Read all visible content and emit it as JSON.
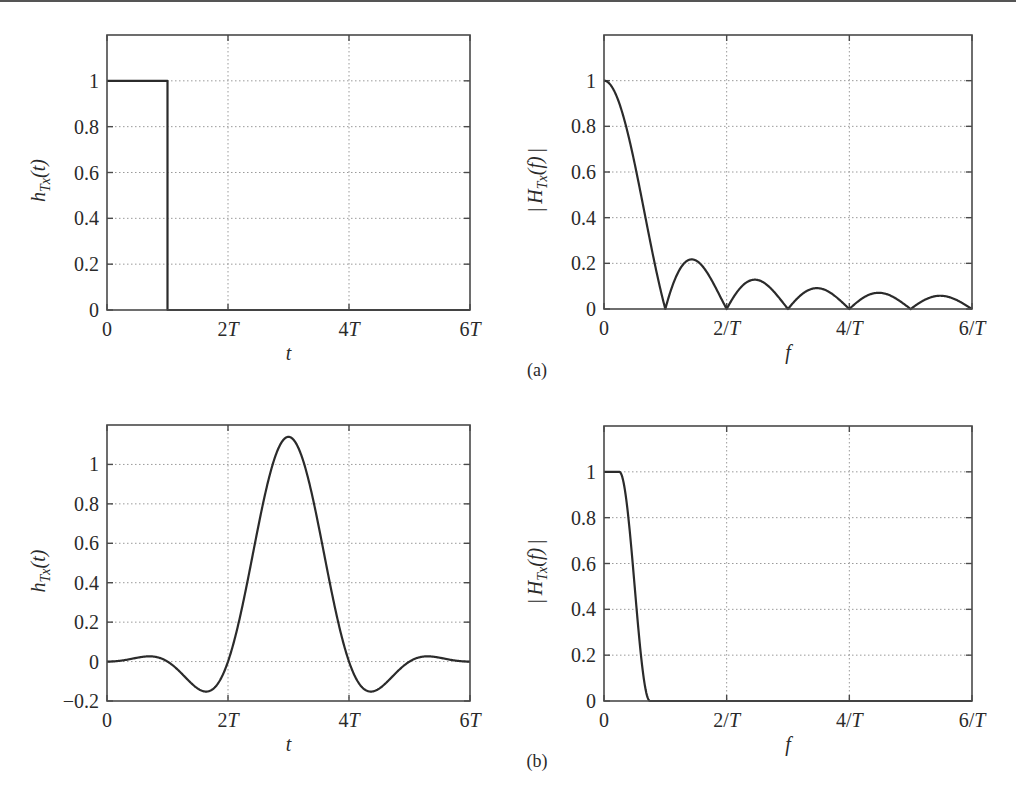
{
  "figure": {
    "panel_labels": [
      "(a)",
      "(b)"
    ]
  },
  "chart_data": [
    {
      "id": "a-time",
      "type": "line",
      "panel": "(a)",
      "title": "",
      "xlabel": "t",
      "ylabel": "h_Tx(t)",
      "ylabel_parts": {
        "base": "h",
        "sub": "Tx",
        "suffix": "(t)"
      },
      "xlim": [
        0,
        6
      ],
      "ylim": [
        0,
        1.2
      ],
      "xticks": [
        0,
        2,
        4,
        6
      ],
      "xtick_labels": [
        "0",
        "2T",
        "4T",
        "6T"
      ],
      "yticks": [
        0,
        0.2,
        0.4,
        0.6,
        0.8,
        1
      ],
      "ytick_labels": [
        "0",
        "0.2",
        "0.4",
        "0.6",
        "0.8",
        "1"
      ],
      "grid": true,
      "description": "Rectangular pulse of height 1 from t=0 to t=T",
      "series": [
        {
          "name": "h_Tx(t)",
          "x": [
            0,
            0,
            1,
            1,
            6
          ],
          "y": [
            1,
            1,
            1,
            0,
            0
          ]
        }
      ],
      "box": {
        "left": 107,
        "top": 35,
        "right": 470,
        "bottom": 310
      }
    },
    {
      "id": "a-freq",
      "type": "line",
      "panel": "(a)",
      "title": "",
      "xlabel": "f",
      "ylabel": "|H_Tx(f)|",
      "ylabel_parts": {
        "base": "H",
        "sub": "Tx",
        "suffix": "(f)"
      },
      "xlim": [
        0,
        6
      ],
      "ylim": [
        0,
        1.2
      ],
      "xticks": [
        0,
        2,
        4,
        6
      ],
      "xtick_labels": [
        "0",
        "2/T",
        "4/T",
        "6/T"
      ],
      "yticks": [
        0,
        0.2,
        0.4,
        0.6,
        0.8,
        1
      ],
      "ytick_labels": [
        "0",
        "0.2",
        "0.4",
        "0.6",
        "0.8",
        "1"
      ],
      "grid": true,
      "description": "|sinc(fT)|, zeros at integer multiples of 1/T",
      "series": [
        {
          "name": "|H_Tx(f)|",
          "x": [
            0,
            0.25,
            0.5,
            0.75,
            1,
            1.25,
            1.5,
            1.75,
            2,
            2.25,
            2.5,
            2.75,
            3,
            3.25,
            3.5,
            3.75,
            4,
            4.25,
            4.5,
            4.75,
            5,
            5.25,
            5.5,
            5.75,
            6
          ],
          "y": [
            1,
            0.9,
            0.637,
            0.3,
            0,
            0.18,
            0.212,
            0.129,
            0,
            0.1,
            0.127,
            0.082,
            0,
            0.069,
            0.091,
            0.06,
            0,
            0.053,
            0.071,
            0.047,
            0,
            0.043,
            0.058,
            0.039,
            0
          ]
        }
      ],
      "box": {
        "left": 604,
        "top": 35,
        "right": 972,
        "bottom": 309
      }
    },
    {
      "id": "b-time",
      "type": "line",
      "panel": "(b)",
      "title": "",
      "xlabel": "t",
      "ylabel": "h_Tx(t)",
      "ylabel_parts": {
        "base": "h",
        "sub": "Tx",
        "suffix": "(t)"
      },
      "xlim": [
        0,
        6
      ],
      "ylim": [
        -0.2,
        1.2
      ],
      "xticks": [
        0,
        2,
        4,
        6
      ],
      "xtick_labels": [
        "0",
        "2T",
        "4T",
        "6T"
      ],
      "yticks": [
        -0.2,
        0,
        0.2,
        0.4,
        0.6,
        0.8,
        1
      ],
      "ytick_labels": [
        "−0.2",
        "0",
        "0.2",
        "0.4",
        "0.6",
        "0.8",
        "1"
      ],
      "grid": true,
      "description": "Raised-cosine pulse (rolloff 0.5) centered at 3T, peak about 1.14",
      "model": {
        "kind": "raised-cosine-time",
        "center": 3,
        "beta": 0.5,
        "scale": 1.14
      },
      "series": [
        {
          "name": "h_Tx(t)",
          "x": [
            0,
            0.5,
            1,
            1.5,
            1.8,
            2,
            2.5,
            3,
            3.5,
            4,
            4.2,
            4.5,
            5,
            5.5,
            6
          ],
          "y": [
            0,
            -0.02,
            0.04,
            -0.08,
            -0.16,
            -0.13,
            0.55,
            1.14,
            0.55,
            -0.13,
            -0.16,
            -0.08,
            0.04,
            -0.02,
            0
          ]
        }
      ],
      "box": {
        "left": 107,
        "top": 425,
        "right": 470,
        "bottom": 701
      }
    },
    {
      "id": "b-freq",
      "type": "line",
      "panel": "(b)",
      "title": "",
      "xlabel": "f",
      "ylabel": "|H_Tx(f)|",
      "ylabel_parts": {
        "base": "H",
        "sub": "Tx",
        "suffix": "(f)"
      },
      "xlim": [
        0,
        6
      ],
      "ylim": [
        0,
        1.2
      ],
      "xticks": [
        0,
        2,
        4,
        6
      ],
      "xtick_labels": [
        "0",
        "2/T",
        "4/T",
        "6/T"
      ],
      "yticks": [
        0,
        0.2,
        0.4,
        0.6,
        0.8,
        1
      ],
      "ytick_labels": [
        "0",
        "0.2",
        "0.4",
        "0.6",
        "0.8",
        "1"
      ],
      "grid": true,
      "description": "Raised-cosine spectrum: flat at 1 up to 0.25/T, rolls off to 0 at 0.75/T",
      "model": {
        "kind": "raised-cosine-freq",
        "f1": 0.25,
        "f2": 0.75
      },
      "series": [
        {
          "name": "|H_Tx(f)|",
          "x": [
            0,
            0.25,
            0.375,
            0.5,
            0.625,
            0.75,
            6
          ],
          "y": [
            1,
            1,
            0.854,
            0.5,
            0.146,
            0,
            0
          ]
        }
      ],
      "box": {
        "left": 604,
        "top": 426,
        "right": 972,
        "bottom": 701
      }
    }
  ]
}
